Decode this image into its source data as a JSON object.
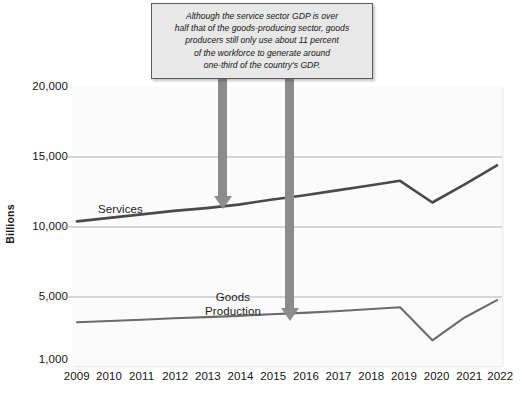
{
  "chart_data": {
    "type": "line",
    "title": "",
    "xlabel": "",
    "ylabel": "Billions",
    "x": [
      2009,
      2010,
      2011,
      2012,
      2013,
      2014,
      2015,
      2016,
      2017,
      2018,
      2019,
      2020,
      2021,
      2022
    ],
    "categories": [
      "2009",
      "2010",
      "2011",
      "2012",
      "2013",
      "2014",
      "2015",
      "2016",
      "2017",
      "2018",
      "2019",
      "2020",
      "2021",
      "2022"
    ],
    "xtick_labels": [
      "2009",
      "2010",
      "2011",
      "2012",
      "2013",
      "2014",
      "2015",
      "2016",
      "2017",
      "2018",
      "2019",
      "2020",
      "2021",
      "2022"
    ],
    "ytick_labels": [
      "20,000",
      "15,000",
      "10,000",
      "5,000",
      "1,000"
    ],
    "ytick_values": [
      20000,
      15000,
      10000,
      5000,
      1000
    ],
    "ylim": [
      1000,
      20000
    ],
    "grid": "horizontal",
    "gridlines_at": [
      15000,
      10000,
      5000
    ],
    "legend": "inline-labels",
    "series": [
      {
        "name": "Services",
        "color": "#4a4a4a",
        "values": [
          10400,
          10650,
          10900,
          11150,
          11350,
          11600,
          11950,
          12250,
          12600,
          12950,
          13300,
          11750,
          13050,
          14400
        ]
      },
      {
        "name": "Goods Production",
        "color": "#6b6b6b",
        "values": [
          3400,
          3480,
          3560,
          3650,
          3720,
          3800,
          3900,
          3990,
          4100,
          4220,
          4350,
          2250,
          3700,
          4800
        ]
      }
    ],
    "annotations": [
      {
        "name": "callout-note",
        "text_lines": [
          "Although the service sector GDP is over",
          "half that of the goods-producing sector, goods",
          "producers still only use about 11 percent",
          "of the workforce to generate around",
          "one-third of the country's GDP."
        ]
      },
      {
        "name": "arrow-to-services",
        "points_to_series": "Services",
        "points_to_x": 2014
      },
      {
        "name": "arrow-to-goods-production",
        "points_to_series": "Goods Production",
        "points_to_x": 2015.6
      }
    ],
    "series_inline_labels": [
      {
        "name": "Services",
        "lines": [
          "Services"
        ]
      },
      {
        "name": "Goods Production",
        "lines": [
          "Goods",
          "Production"
        ]
      }
    ]
  },
  "colors": {
    "services_line": "#4a4a4a",
    "goods_line": "#6b6b6b",
    "arrow": "#8c8c8c",
    "gridline": "#a8a8a8",
    "callout_bg": "#e8e8e8",
    "callout_border": "#5a5a5a",
    "plot_bg": "#fbfbfb",
    "text": "#141414"
  }
}
